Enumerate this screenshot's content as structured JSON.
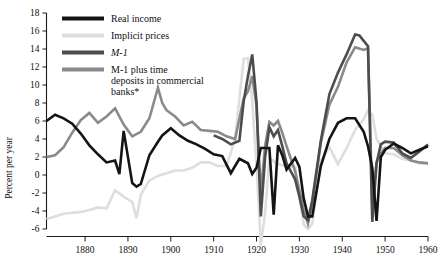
{
  "chart_data": {
    "type": "line",
    "title": "",
    "xlabel": "",
    "ylabel": "Percent per year",
    "xlim": [
      1871,
      1960
    ],
    "ylim": [
      -6,
      18
    ],
    "ytick_values": [
      18,
      16,
      14,
      12,
      10,
      8,
      6,
      4,
      2,
      0,
      -2,
      -4,
      -6
    ],
    "ytick_labels": [
      "18",
      "16",
      "14",
      "12",
      "10",
      "8",
      "6",
      "4",
      "2",
      "0",
      "-2",
      "-4",
      "-6"
    ],
    "xtick_values": [
      1880,
      1890,
      1900,
      1910,
      1920,
      1930,
      1940,
      1950,
      1960
    ],
    "xtick_labels": [
      "1880",
      "1890",
      "1900",
      "1910",
      "1920",
      "1930",
      "1940",
      "1950",
      "1960"
    ],
    "grid": false,
    "legend_position": "top-center",
    "series": [
      {
        "name": "Real income",
        "color": "#141414",
        "width": 2.6,
        "x": [
          1871,
          1873,
          1875,
          1877,
          1879,
          1881,
          1883,
          1885,
          1887,
          1888,
          1889,
          1891,
          1892,
          1893,
          1895,
          1897,
          1898,
          1900,
          1902,
          1904,
          1906,
          1908,
          1910,
          1912,
          1914,
          1916,
          1918,
          1919,
          1920,
          1921,
          1922,
          1923,
          1924,
          1925,
          1926,
          1927,
          1929,
          1930,
          1931,
          1932,
          1933,
          1935,
          1937,
          1939,
          1941,
          1943,
          1945,
          1946,
          1947,
          1948,
          1949,
          1950,
          1952,
          1954,
          1956,
          1958,
          1960
        ],
        "values": [
          6.0,
          6.7,
          6.3,
          5.7,
          4.6,
          3.3,
          2.3,
          1.4,
          1.6,
          0.1,
          4.9,
          -0.9,
          -1.3,
          -1.0,
          2.2,
          3.7,
          4.4,
          5.2,
          4.4,
          3.8,
          3.4,
          2.9,
          2.3,
          2.1,
          0.2,
          1.8,
          1.3,
          0.1,
          0.8,
          3.0,
          3.0,
          3.0,
          -4.4,
          3.3,
          2.2,
          0.6,
          1.9,
          0.9,
          -2.6,
          -4.6,
          -4.6,
          1.0,
          4.0,
          5.8,
          6.3,
          6.3,
          4.8,
          3.2,
          0.8,
          -5.1,
          2.0,
          2.8,
          3.5,
          3.0,
          2.4,
          2.8,
          3.2
        ]
      },
      {
        "name": "Implicit prices",
        "color": "#dedede",
        "width": 2.6,
        "x": [
          1871,
          1873,
          1875,
          1877,
          1879,
          1881,
          1883,
          1885,
          1887,
          1889,
          1891,
          1892,
          1893,
          1895,
          1897,
          1899,
          1901,
          1903,
          1905,
          1907,
          1909,
          1911,
          1913,
          1915,
          1917,
          1918,
          1919,
          1920,
          1921,
          1922,
          1923,
          1925,
          1927,
          1929,
          1931,
          1932,
          1933,
          1935,
          1937,
          1939,
          1941,
          1943,
          1945,
          1946,
          1947,
          1948,
          1950,
          1952,
          1954,
          1956,
          1958,
          1960
        ],
        "values": [
          -4.9,
          -4.6,
          -4.3,
          -4.2,
          -4.1,
          -3.9,
          -3.6,
          -3.7,
          -1.7,
          -2.4,
          -3.0,
          -4.8,
          -2.2,
          -0.6,
          -0.1,
          0.2,
          0.5,
          0.5,
          0.8,
          1.4,
          1.4,
          1.0,
          1.0,
          4.0,
          12.9,
          13.0,
          8.1,
          1.0,
          -7.8,
          -4.2,
          1.9,
          1.2,
          1.0,
          0.9,
          -5.5,
          -6.0,
          -5.4,
          1.6,
          3.1,
          1.2,
          3.0,
          5.0,
          6.2,
          7.2,
          6.7,
          4.0,
          2.4,
          2.3,
          1.8,
          1.6,
          1.3,
          1.2
        ]
      },
      {
        "name": "M-1",
        "color": "#4d4d4d",
        "width": 2.6,
        "x": [
          1910,
          1912,
          1914,
          1916,
          1917,
          1918,
          1919,
          1920,
          1921,
          1922,
          1923,
          1924,
          1925,
          1926,
          1927,
          1929,
          1930,
          1931,
          1932,
          1933,
          1935,
          1937,
          1939,
          1941,
          1943,
          1944,
          1945,
          1946,
          1947,
          1948,
          1949,
          1950,
          1952,
          1954,
          1956,
          1958,
          1960
        ],
        "values": [
          4.4,
          4.0,
          3.4,
          3.8,
          8.2,
          11.0,
          13.4,
          8.1,
          -4.6,
          2.0,
          5.3,
          4.3,
          5.0,
          3.2,
          1.3,
          -0.5,
          -2.4,
          -4.6,
          -5.0,
          -2.8,
          3.8,
          9.0,
          11.4,
          13.4,
          15.6,
          15.5,
          14.9,
          14.3,
          -5.2,
          1.3,
          3.4,
          3.7,
          3.6,
          2.4,
          1.9,
          2.6,
          3.4
        ]
      },
      {
        "name": "M-1 plus time deposits in commercial banks*",
        "color": "#8a8a8a",
        "width": 2.6,
        "x": [
          1871,
          1873,
          1875,
          1877,
          1879,
          1881,
          1883,
          1885,
          1887,
          1889,
          1891,
          1893,
          1895,
          1897,
          1898,
          1899,
          1901,
          1903,
          1905,
          1907,
          1909,
          1911,
          1913,
          1915,
          1917,
          1918,
          1919,
          1920,
          1921,
          1922,
          1923,
          1924,
          1925,
          1926,
          1927,
          1929,
          1930,
          1931,
          1932,
          1933,
          1935,
          1937,
          1939,
          1941,
          1943,
          1945,
          1946,
          1947,
          1948,
          1949,
          1950,
          1952,
          1954,
          1956,
          1958,
          1960
        ],
        "values": [
          2.0,
          2.2,
          3.1,
          4.7,
          6.1,
          6.9,
          5.8,
          6.5,
          7.4,
          5.6,
          4.3,
          4.8,
          6.3,
          9.7,
          8.0,
          7.2,
          6.5,
          5.5,
          5.9,
          5.0,
          4.9,
          4.8,
          4.3,
          4.0,
          8.5,
          9.3,
          11.0,
          7.6,
          -2.1,
          3.3,
          5.9,
          5.5,
          6.0,
          4.7,
          3.2,
          0.4,
          -1.7,
          -3.9,
          -5.4,
          -3.1,
          3.6,
          7.8,
          9.8,
          12.5,
          14.2,
          13.9,
          14.1,
          -3.4,
          1.4,
          2.4,
          3.0,
          3.0,
          2.2,
          1.6,
          1.4,
          1.3
        ]
      }
    ]
  },
  "legend": {
    "entries": [
      {
        "label": "Real income",
        "color": "#141414"
      },
      {
        "label": "Implicit prices",
        "color": "#dedede"
      },
      {
        "label": "M-1",
        "color": "#4d4d4d"
      },
      {
        "label": "M-1 plus time",
        "label2": "deposits in commercial",
        "label3": "banks*",
        "color": "#8a8a8a"
      }
    ]
  },
  "axes": {
    "ylabel": "Percent per year",
    "y_ticks": [
      "18",
      "16",
      "14",
      "12",
      "10",
      "8",
      "6",
      "4",
      "2",
      "0",
      "-2",
      "-4",
      "-6"
    ],
    "x_ticks": [
      "1880",
      "1890",
      "1900",
      "1910",
      "1920",
      "1930",
      "1940",
      "1950",
      "1960"
    ]
  }
}
